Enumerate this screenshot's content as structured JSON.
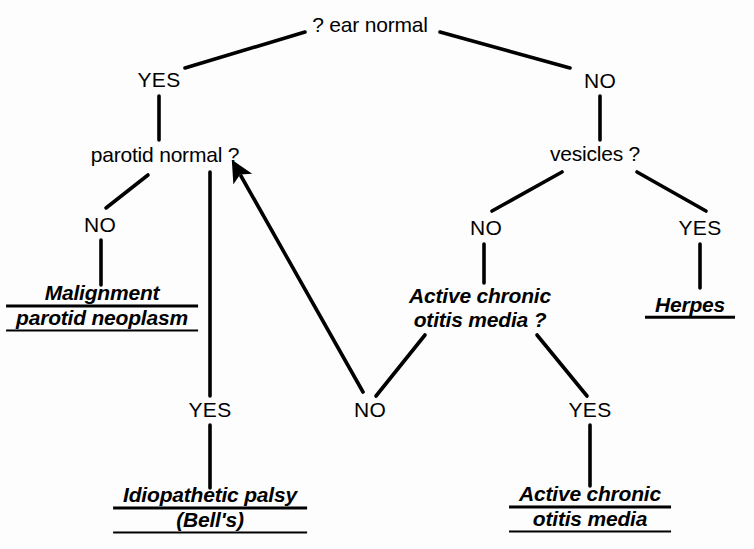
{
  "diagram": {
    "type": "decision-tree",
    "title_visible": false,
    "background_color": "#fdfdfd",
    "ink_color": "#000000",
    "nodes": {
      "root": {
        "text": "? ear normal",
        "kind": "question",
        "style": "plain",
        "x": 370,
        "y": 25
      },
      "parotid": {
        "text": "parotid normal ?",
        "kind": "question",
        "style": "plain",
        "x": 165,
        "y": 155
      },
      "vesicles": {
        "text": "vesicles ?",
        "kind": "question",
        "style": "plain",
        "x": 595,
        "y": 154
      },
      "active_chronic_q_l1": {
        "text": "Active chronic",
        "kind": "question",
        "style": "italic",
        "x": 480,
        "y": 297
      },
      "active_chronic_q_l2": {
        "text": "otitis media ?",
        "kind": "question",
        "style": "italic",
        "x": 480,
        "y": 320
      }
    },
    "leaves": {
      "malignment": {
        "lines": [
          "Malignment",
          "parotid neoplasm"
        ],
        "x": 102,
        "y": 306
      },
      "idiopathic": {
        "lines": [
          "Idiopathetic palsy",
          "(Bell's)"
        ],
        "x": 210,
        "y": 508
      },
      "herpes": {
        "lines": [
          "Herpes"
        ],
        "x": 690,
        "y": 305
      },
      "aco_leaf": {
        "lines": [
          "Active chronic",
          "otitis media"
        ],
        "x": 590,
        "y": 507
      }
    },
    "branch_labels": [
      {
        "id": "root-yes",
        "text": "YES",
        "x": 159,
        "y": 80,
        "from": "root",
        "to": "parotid"
      },
      {
        "id": "root-no",
        "text": "NO",
        "x": 600,
        "y": 81,
        "from": "root",
        "to": "vesicles"
      },
      {
        "id": "parotid-no",
        "text": "NO",
        "x": 100,
        "y": 225,
        "from": "parotid",
        "to": "malignment"
      },
      {
        "id": "parotid-yes",
        "text": "YES",
        "x": 210,
        "y": 410,
        "from": "parotid",
        "to": "idiopathic"
      },
      {
        "id": "vesicles-no",
        "text": "NO",
        "x": 486,
        "y": 228,
        "from": "vesicles",
        "to": "active_chronic_q"
      },
      {
        "id": "vesicles-yes",
        "text": "YES",
        "x": 700,
        "y": 228,
        "from": "vesicles",
        "to": "herpes"
      },
      {
        "id": "aco-no",
        "text": "NO",
        "x": 370,
        "y": 410,
        "from": "active_chronic_q",
        "to": "parotid"
      },
      {
        "id": "aco-yes",
        "text": "YES",
        "x": 590,
        "y": 410,
        "from": "active_chronic_q",
        "to": "aco_leaf"
      }
    ],
    "edges": [
      {
        "id": "e-root-yes",
        "kind": "diagonal",
        "x1": 305,
        "y1": 32,
        "x2": 185,
        "y2": 68
      },
      {
        "id": "e-root-no",
        "kind": "diagonal",
        "x1": 440,
        "y1": 32,
        "x2": 570,
        "y2": 68
      },
      {
        "id": "e-yes-parotid",
        "kind": "vertical",
        "x1": 159,
        "y1": 96,
        "x2": 159,
        "y2": 140
      },
      {
        "id": "e-no-vesicles",
        "kind": "vertical",
        "x1": 600,
        "y1": 96,
        "x2": 600,
        "y2": 140
      },
      {
        "id": "e-parotid-no",
        "kind": "diagonal",
        "x1": 148,
        "y1": 175,
        "x2": 106,
        "y2": 208
      },
      {
        "id": "e-no-malign",
        "kind": "vertical",
        "x1": 101,
        "y1": 240,
        "x2": 101,
        "y2": 285
      },
      {
        "id": "e-parotid-yes",
        "kind": "vertical",
        "x1": 210,
        "y1": 172,
        "x2": 210,
        "y2": 396
      },
      {
        "id": "e-yes-idio",
        "kind": "vertical",
        "x1": 210,
        "y1": 425,
        "x2": 210,
        "y2": 488
      },
      {
        "id": "e-ves-no",
        "kind": "diagonal",
        "x1": 562,
        "y1": 172,
        "x2": 492,
        "y2": 211
      },
      {
        "id": "e-ves-yes",
        "kind": "diagonal",
        "x1": 637,
        "y1": 172,
        "x2": 706,
        "y2": 211
      },
      {
        "id": "e-no-aco",
        "kind": "vertical",
        "x1": 484,
        "y1": 244,
        "x2": 484,
        "y2": 283
      },
      {
        "id": "e-yes-herpes",
        "kind": "vertical",
        "x1": 700,
        "y1": 244,
        "x2": 700,
        "y2": 288
      },
      {
        "id": "e-aco-no",
        "kind": "diagonal",
        "x1": 425,
        "y1": 335,
        "x2": 376,
        "y2": 396
      },
      {
        "id": "e-aco-yes",
        "kind": "diagonal",
        "x1": 537,
        "y1": 335,
        "x2": 587,
        "y2": 396
      },
      {
        "id": "e-aco-yes-leaf",
        "kind": "vertical",
        "x1": 590,
        "y1": 425,
        "x2": 590,
        "y2": 486
      }
    ],
    "feedback_arrow": {
      "id": "e-aco-no-to-parotid",
      "label": "NO",
      "x1": 363,
      "y1": 392,
      "x2": 241,
      "y2": 176,
      "arrowhead_at": "parotid normal ?"
    }
  }
}
